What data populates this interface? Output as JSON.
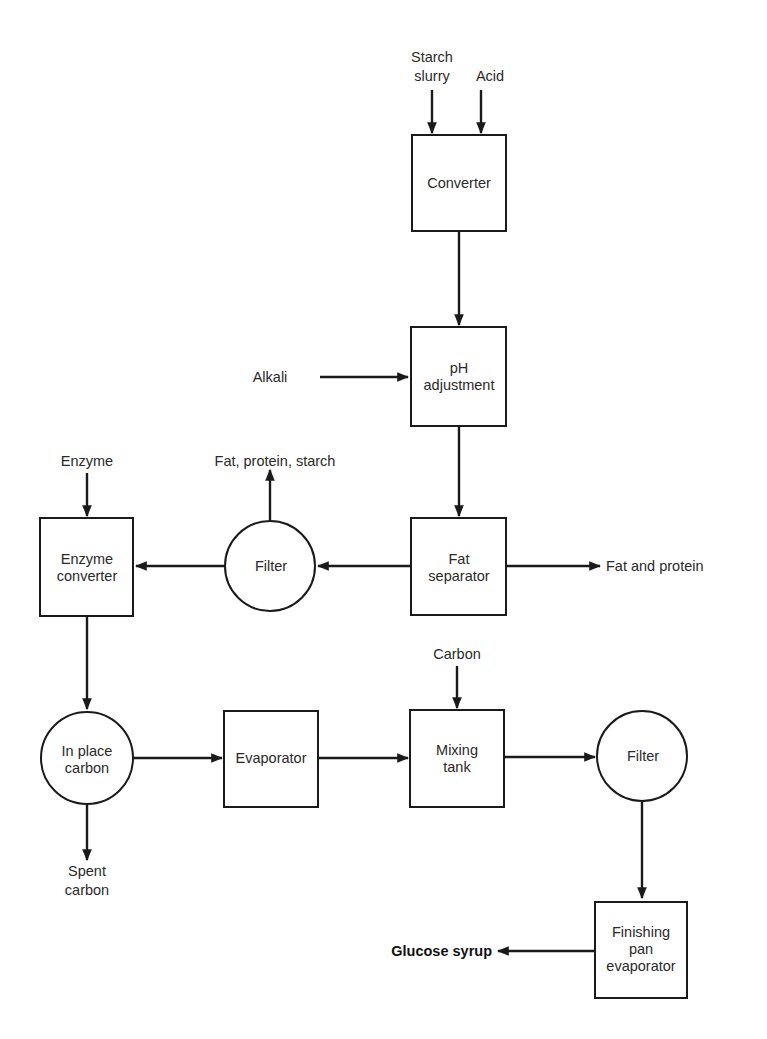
{
  "diagram": {
    "type": "process-flow",
    "colors": {
      "line": "#1a1a1a",
      "text": "#2a2a2a",
      "background": "#ffffff"
    },
    "nodes": {
      "converter": {
        "shape": "rectangle",
        "lines": [
          "Converter"
        ]
      },
      "ph_adjustment": {
        "shape": "rectangle",
        "lines": [
          "pH",
          "adjustment"
        ]
      },
      "fat_separator": {
        "shape": "rectangle",
        "lines": [
          "Fat",
          "separator"
        ]
      },
      "filter1": {
        "shape": "circle",
        "lines": [
          "Filter"
        ]
      },
      "enzyme_converter": {
        "shape": "rectangle",
        "lines": [
          "Enzyme",
          "converter"
        ]
      },
      "in_place_carbon": {
        "shape": "circle",
        "lines": [
          "In place",
          "carbon"
        ]
      },
      "evaporator": {
        "shape": "rectangle",
        "lines": [
          "Evaporator"
        ]
      },
      "mixing_tank": {
        "shape": "rectangle",
        "lines": [
          "Mixing",
          "tank"
        ]
      },
      "filter2": {
        "shape": "circle",
        "lines": [
          "Filter"
        ]
      },
      "finishing_pan_evaporator": {
        "shape": "rectangle",
        "lines": [
          "Finishing",
          "pan",
          "evaporator"
        ]
      }
    },
    "io": {
      "starch_slurry": {
        "lines": [
          "Starch",
          "slurry"
        ]
      },
      "acid": {
        "lines": [
          "Acid"
        ]
      },
      "alkali": {
        "lines": [
          "Alkali"
        ]
      },
      "enzyme": {
        "lines": [
          "Enzyme"
        ]
      },
      "fat_protein_starch": {
        "lines": [
          "Fat,  protein, starch"
        ]
      },
      "fat_and_protein": {
        "lines": [
          "Fat and protein"
        ]
      },
      "carbon": {
        "lines": [
          "Carbon"
        ]
      },
      "spent_carbon": {
        "lines": [
          "Spent",
          "carbon"
        ]
      },
      "glucose_syrup": {
        "lines": [
          "Glucose syrup"
        ]
      }
    },
    "edges": [
      {
        "from": "Starch slurry",
        "to": "Converter"
      },
      {
        "from": "Acid",
        "to": "Converter"
      },
      {
        "from": "Converter",
        "to": "pH adjustment"
      },
      {
        "from": "Alkali",
        "to": "pH adjustment"
      },
      {
        "from": "pH adjustment",
        "to": "Fat separator"
      },
      {
        "from": "Fat separator",
        "to": "Fat and protein"
      },
      {
        "from": "Fat separator",
        "to": "Filter"
      },
      {
        "from": "Filter",
        "to": "Fat, protein, starch"
      },
      {
        "from": "Filter",
        "to": "Enzyme converter"
      },
      {
        "from": "Enzyme",
        "to": "Enzyme converter"
      },
      {
        "from": "Enzyme converter",
        "to": "In place carbon"
      },
      {
        "from": "In place carbon",
        "to": "Spent carbon"
      },
      {
        "from": "In place carbon",
        "to": "Evaporator"
      },
      {
        "from": "Evaporator",
        "to": "Mixing tank"
      },
      {
        "from": "Carbon",
        "to": "Mixing tank"
      },
      {
        "from": "Mixing tank",
        "to": "Filter"
      },
      {
        "from": "Filter",
        "to": "Finishing pan evaporator"
      },
      {
        "from": "Finishing pan evaporator",
        "to": "Glucose syrup"
      }
    ]
  }
}
